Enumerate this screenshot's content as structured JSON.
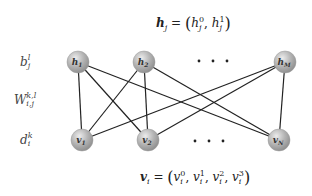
{
  "top_equation": {
    "lhs": "h",
    "lhs_sub": "j",
    "eq": "=",
    "terms": [
      {
        "base": "h",
        "sup": "0",
        "sub": "j"
      },
      {
        "base": "h",
        "sup": "1",
        "sub": "j"
      }
    ]
  },
  "bottom_equation": {
    "lhs": "v",
    "lhs_sub": "i",
    "eq": "=",
    "terms": [
      {
        "base": "v",
        "sup": "0",
        "sub": "i"
      },
      {
        "base": "v",
        "sup": "1",
        "sub": "i"
      },
      {
        "base": "v",
        "sup": "2",
        "sub": "i"
      },
      {
        "base": "v",
        "sup": "3",
        "sub": "i"
      }
    ]
  },
  "side_labels": {
    "bias_hidden": {
      "base": "b",
      "sup": "l",
      "sub": "j"
    },
    "weights": {
      "base": "W",
      "sup": "k,l",
      "sub": "i,j"
    },
    "bias_visible": {
      "base": "d",
      "sup": "k",
      "sub": "i"
    }
  },
  "hidden_nodes": [
    {
      "id": "h1",
      "base": "h",
      "sub": "1",
      "x": 78,
      "y": 62
    },
    {
      "id": "h2",
      "base": "h",
      "sub": "2",
      "x": 144,
      "y": 62
    },
    {
      "id": "hM",
      "base": "h",
      "sub": "M",
      "x": 285,
      "y": 62
    }
  ],
  "visible_nodes": [
    {
      "id": "v1",
      "base": "v",
      "sub": "1",
      "x": 82,
      "y": 140
    },
    {
      "id": "v2",
      "base": "v",
      "sub": "2",
      "x": 148,
      "y": 140
    },
    {
      "id": "vN",
      "base": "v",
      "sub": "N",
      "x": 279,
      "y": 140
    }
  ],
  "edges": [
    [
      "h1",
      "v1"
    ],
    [
      "h1",
      "v2"
    ],
    [
      "h1",
      "vN"
    ],
    [
      "h2",
      "v1"
    ],
    [
      "h2",
      "v2"
    ],
    [
      "h2",
      "vN"
    ],
    [
      "hM",
      "v1"
    ],
    [
      "hM",
      "v2"
    ],
    [
      "hM",
      "vN"
    ]
  ],
  "ellipsis": "· · ·",
  "colors": {
    "node_fill": "#a8a8a8",
    "node_highlight": "#e6e6e6",
    "edge": "#222222",
    "text": "#222222"
  }
}
